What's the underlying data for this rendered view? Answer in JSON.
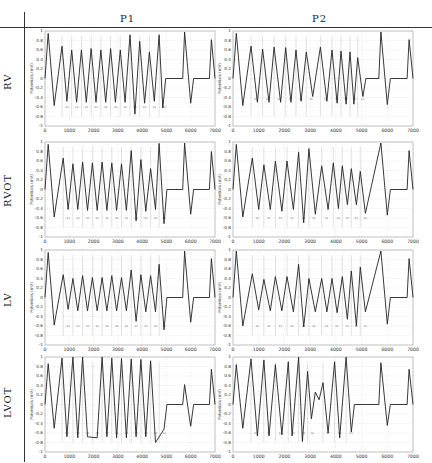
{
  "header": {
    "columns": [
      "P1",
      "P2"
    ]
  },
  "rows": [
    "RV",
    "RVOT",
    "LV",
    "LVOT"
  ],
  "axis": {
    "ylabel": "Potentials (mV)",
    "yticks": [
      0.8,
      0.6,
      0.4,
      0.2,
      0,
      -0.2,
      -0.4,
      -0.6,
      -0.8,
      -1
    ],
    "ytop_label": "1",
    "xticks": [
      0,
      1000,
      2000,
      3000,
      4000,
      5000,
      6000,
      7000
    ]
  },
  "colors": {
    "trace": "#222222",
    "grid": "#c8c8c8",
    "segment_line": "#9a9a9a"
  },
  "chart_data": [
    {
      "type": "line",
      "row": "RV",
      "column": "P1",
      "xlabel": "",
      "ylabel": "Potentials (mV)",
      "xlim": [
        0,
        7000
      ],
      "ylim": [
        -1,
        1
      ],
      "peaks": [
        [
          130,
          0.95
        ],
        [
          700,
          0.68
        ],
        [
          1100,
          0.6
        ],
        [
          1500,
          0.6
        ],
        [
          1900,
          0.63
        ],
        [
          2300,
          0.6
        ],
        [
          2700,
          0.63
        ],
        [
          3100,
          0.6
        ],
        [
          3500,
          0.92
        ],
        [
          3900,
          0.78
        ],
        [
          4300,
          0.56
        ],
        [
          4700,
          0.92
        ],
        [
          5750,
          0.98
        ],
        [
          6850,
          0.82
        ]
      ],
      "troughs": [
        [
          380,
          -0.57
        ],
        [
          900,
          -0.48
        ],
        [
          1300,
          -0.5
        ],
        [
          1700,
          -0.5
        ],
        [
          2100,
          -0.5
        ],
        [
          2500,
          -0.5
        ],
        [
          2900,
          -0.5
        ],
        [
          3300,
          -0.5
        ],
        [
          3700,
          -0.75
        ],
        [
          4100,
          -0.52
        ],
        [
          4500,
          -0.48
        ],
        [
          4850,
          -0.62
        ],
        [
          6000,
          -0.52
        ]
      ],
      "segment_marks": [
        700,
        1100,
        1500,
        1900,
        2300,
        2700,
        3100,
        3500,
        3900,
        4300,
        4700
      ],
      "segment_label_y": -0.62
    },
    {
      "type": "line",
      "row": "RV",
      "column": "P2",
      "xlabel": "",
      "ylabel": "Potentials (mV)",
      "xlim": [
        0,
        7000
      ],
      "ylim": [
        -1,
        1
      ],
      "peaks": [
        [
          130,
          0.95
        ],
        [
          700,
          0.68
        ],
        [
          1150,
          0.62
        ],
        [
          1600,
          0.66
        ],
        [
          2050,
          0.65
        ],
        [
          2450,
          0.6
        ],
        [
          2850,
          0.56
        ],
        [
          3400,
          0.66
        ],
        [
          3850,
          0.6
        ],
        [
          4200,
          0.58
        ],
        [
          4550,
          0.56
        ],
        [
          4850,
          0.44
        ],
        [
          5750,
          0.98
        ],
        [
          6850,
          0.82
        ]
      ],
      "troughs": [
        [
          380,
          -0.57
        ],
        [
          950,
          -0.5
        ],
        [
          1400,
          -0.5
        ],
        [
          1850,
          -0.5
        ],
        [
          2250,
          -0.5
        ],
        [
          2650,
          -0.48
        ],
        [
          3100,
          -0.38
        ],
        [
          3650,
          -0.48
        ],
        [
          4050,
          -0.52
        ],
        [
          4400,
          -0.54
        ],
        [
          4700,
          -0.54
        ],
        [
          5050,
          -0.38
        ],
        [
          6000,
          -0.55
        ]
      ],
      "segment_marks": [
        700,
        1150,
        1600,
        2050,
        2450,
        2850,
        3400,
        3850,
        4200,
        4550,
        4850
      ],
      "segment_label_y": -0.45
    },
    {
      "type": "line",
      "row": "RVOT",
      "column": "P1",
      "xlabel": "",
      "ylabel": "Potentials (mV)",
      "xlim": [
        0,
        7000
      ],
      "ylim": [
        -1,
        1
      ],
      "peaks": [
        [
          130,
          0.95
        ],
        [
          750,
          0.66
        ],
        [
          1150,
          0.54
        ],
        [
          1550,
          0.58
        ],
        [
          1950,
          0.56
        ],
        [
          2350,
          0.58
        ],
        [
          2750,
          0.56
        ],
        [
          3150,
          0.54
        ],
        [
          3550,
          0.82
        ],
        [
          3950,
          0.63
        ],
        [
          4350,
          0.44
        ],
        [
          4700,
          0.97
        ],
        [
          5750,
          0.98
        ],
        [
          6850,
          0.8
        ]
      ],
      "troughs": [
        [
          380,
          -0.58
        ],
        [
          950,
          -0.42
        ],
        [
          1350,
          -0.42
        ],
        [
          1750,
          -0.44
        ],
        [
          2150,
          -0.44
        ],
        [
          2550,
          -0.44
        ],
        [
          2950,
          -0.44
        ],
        [
          3350,
          -0.44
        ],
        [
          3750,
          -0.66
        ],
        [
          4150,
          -0.46
        ],
        [
          4550,
          -0.42
        ],
        [
          4900,
          -0.72
        ],
        [
          6000,
          -0.52
        ]
      ],
      "segment_marks": [
        750,
        1150,
        1550,
        1950,
        2350,
        2750,
        3150,
        3550,
        3950,
        4350,
        4700
      ],
      "segment_label_y": -0.62
    },
    {
      "type": "line",
      "row": "RVOT",
      "column": "P2",
      "xlabel": "",
      "ylabel": "Potentials (mV)",
      "xlim": [
        0,
        7000
      ],
      "ylim": [
        -1,
        1
      ],
      "peaks": [
        [
          130,
          0.95
        ],
        [
          750,
          0.66
        ],
        [
          1200,
          0.52
        ],
        [
          1650,
          0.6
        ],
        [
          2100,
          0.6
        ],
        [
          2550,
          0.78
        ],
        [
          2950,
          0.86
        ],
        [
          3450,
          0.5
        ],
        [
          3900,
          0.56
        ],
        [
          4250,
          0.5
        ],
        [
          4600,
          0.44
        ],
        [
          4950,
          0.38
        ],
        [
          5750,
          0.98
        ],
        [
          6850,
          0.82
        ]
      ],
      "troughs": [
        [
          380,
          -0.58
        ],
        [
          1000,
          -0.42
        ],
        [
          1450,
          -0.42
        ],
        [
          1900,
          -0.46
        ],
        [
          2350,
          -0.42
        ],
        [
          2750,
          -0.7
        ],
        [
          3200,
          -0.52
        ],
        [
          3700,
          -0.42
        ],
        [
          4100,
          -0.4
        ],
        [
          4450,
          -0.32
        ],
        [
          4800,
          -0.32
        ],
        [
          5150,
          -0.5
        ],
        [
          6000,
          -0.54
        ]
      ],
      "segment_marks": [
        750,
        1200,
        1650,
        2100,
        2550,
        2950,
        3450,
        3900,
        4250,
        4600,
        4950
      ],
      "segment_label_y": -0.62
    },
    {
      "type": "line",
      "row": "LV",
      "column": "P1",
      "xlabel": "",
      "ylabel": "Potentials (mV)",
      "xlim": [
        0,
        7000
      ],
      "ylim": [
        -1,
        1
      ],
      "peaks": [
        [
          130,
          0.95
        ],
        [
          750,
          0.48
        ],
        [
          1150,
          0.4
        ],
        [
          1550,
          0.46
        ],
        [
          1950,
          0.42
        ],
        [
          2350,
          0.42
        ],
        [
          2750,
          0.46
        ],
        [
          3150,
          0.42
        ],
        [
          3550,
          0.58
        ],
        [
          3950,
          0.48
        ],
        [
          4350,
          0.46
        ],
        [
          4700,
          0.7
        ],
        [
          5750,
          0.98
        ],
        [
          6850,
          0.82
        ]
      ],
      "troughs": [
        [
          380,
          -0.58
        ],
        [
          950,
          -0.25
        ],
        [
          1350,
          -0.28
        ],
        [
          1750,
          -0.28
        ],
        [
          2150,
          -0.28
        ],
        [
          2550,
          -0.28
        ],
        [
          2950,
          -0.28
        ],
        [
          3350,
          -0.28
        ],
        [
          3750,
          -0.5
        ],
        [
          4150,
          -0.3
        ],
        [
          4550,
          -0.3
        ],
        [
          4900,
          -0.68
        ],
        [
          6000,
          -0.52
        ]
      ],
      "segment_marks": [
        750,
        1150,
        1550,
        1950,
        2350,
        2750,
        3150,
        3550,
        3950,
        4350,
        4700
      ],
      "segment_label_y": -0.62
    },
    {
      "type": "line",
      "row": "LV",
      "column": "P2",
      "xlabel": "",
      "ylabel": "Potentials (mV)",
      "xlim": [
        0,
        7000
      ],
      "ylim": [
        -1,
        1
      ],
      "peaks": [
        [
          130,
          0.98
        ],
        [
          750,
          0.5
        ],
        [
          1200,
          0.38
        ],
        [
          1650,
          0.44
        ],
        [
          2100,
          0.44
        ],
        [
          2550,
          0.7
        ],
        [
          2950,
          0.4
        ],
        [
          3450,
          0.4
        ],
        [
          3850,
          0.4
        ],
        [
          4250,
          0.44
        ],
        [
          4600,
          0.56
        ],
        [
          4950,
          0.64
        ],
        [
          5750,
          0.98
        ],
        [
          6850,
          0.82
        ]
      ],
      "troughs": [
        [
          380,
          -0.6
        ],
        [
          1000,
          -0.26
        ],
        [
          1450,
          -0.28
        ],
        [
          1900,
          -0.28
        ],
        [
          2350,
          -0.3
        ],
        [
          2750,
          -0.62
        ],
        [
          3200,
          -0.3
        ],
        [
          3650,
          -0.3
        ],
        [
          4050,
          -0.32
        ],
        [
          4450,
          -0.46
        ],
        [
          4800,
          -0.6
        ],
        [
          5150,
          -0.3
        ],
        [
          6000,
          -0.56
        ]
      ],
      "segment_marks": [
        750,
        1200,
        1650,
        2100,
        2550,
        2950,
        3450,
        3850,
        4250,
        4600,
        4950
      ],
      "segment_label_y": -0.62
    },
    {
      "type": "line",
      "row": "LVOT",
      "column": "P1",
      "xlabel": "",
      "ylabel": "Potentials (mV)",
      "xlim": [
        0,
        7000
      ],
      "ylim": [
        -1,
        1
      ],
      "peaks": [
        [
          130,
          0.86
        ],
        [
          700,
          0.98
        ],
        [
          1150,
          1.0
        ],
        [
          1550,
          1.0
        ],
        [
          2350,
          1.0
        ],
        [
          2750,
          0.98
        ],
        [
          3150,
          0.97
        ],
        [
          3550,
          0.96
        ],
        [
          3950,
          0.95
        ],
        [
          4350,
          0.92
        ],
        [
          5750,
          0.42
        ],
        [
          6850,
          0.74
        ]
      ],
      "troughs": [
        [
          380,
          -0.5
        ],
        [
          900,
          -0.68
        ],
        [
          1350,
          -0.7
        ],
        [
          1750,
          -0.68
        ],
        [
          2150,
          -0.7
        ],
        [
          2550,
          -0.68
        ],
        [
          2950,
          -0.7
        ],
        [
          3350,
          -0.7
        ],
        [
          3750,
          -0.68
        ],
        [
          4150,
          -0.68
        ],
        [
          4550,
          -0.8
        ],
        [
          4900,
          -0.52
        ],
        [
          6000,
          -0.46
        ]
      ],
      "segment_marks": [
        700,
        1150,
        1550,
        1950,
        2350,
        2750,
        3150,
        3550,
        3950,
        4350,
        4700
      ],
      "segment_label_y": -0.62
    },
    {
      "type": "line",
      "row": "LVOT",
      "column": "P2",
      "xlabel": "",
      "ylabel": "Potentials (mV)",
      "xlim": [
        0,
        7000
      ],
      "ylim": [
        -1,
        1
      ],
      "peaks": [
        [
          130,
          0.84
        ],
        [
          700,
          0.96
        ],
        [
          1200,
          0.94
        ],
        [
          1650,
          0.84
        ],
        [
          2150,
          0.9
        ],
        [
          2550,
          1.0
        ],
        [
          2900,
          0.7
        ],
        [
          3200,
          0.26
        ],
        [
          3500,
          0.46
        ],
        [
          3950,
          0.9
        ],
        [
          4400,
          1.0
        ],
        [
          5750,
          0.88
        ],
        [
          6850,
          0.74
        ]
      ],
      "troughs": [
        [
          380,
          -0.5
        ],
        [
          950,
          -0.66
        ],
        [
          1400,
          -0.66
        ],
        [
          1900,
          -0.64
        ],
        [
          2300,
          -0.66
        ],
        [
          2700,
          -0.78
        ],
        [
          3050,
          -0.3
        ],
        [
          3350,
          0.1
        ],
        [
          3700,
          -0.6
        ],
        [
          4150,
          -0.7
        ],
        [
          4600,
          -0.58
        ],
        [
          6000,
          -0.44
        ]
      ],
      "segment_marks": [
        700,
        1200,
        1650,
        2150,
        2550,
        2900,
        3500,
        3950,
        4400
      ],
      "segment_label_y": -0.62
    }
  ],
  "panels_layout": [
    {
      "x": 45,
      "y": 31,
      "w": 170,
      "h": 95
    },
    {
      "x": 233,
      "y": 31,
      "w": 180,
      "h": 95
    },
    {
      "x": 45,
      "y": 142,
      "w": 170,
      "h": 95
    },
    {
      "x": 233,
      "y": 142,
      "w": 180,
      "h": 95
    },
    {
      "x": 45,
      "y": 250,
      "w": 170,
      "h": 95
    },
    {
      "x": 233,
      "y": 250,
      "w": 180,
      "h": 95
    },
    {
      "x": 45,
      "y": 357,
      "w": 170,
      "h": 95
    },
    {
      "x": 233,
      "y": 357,
      "w": 180,
      "h": 95
    }
  ]
}
